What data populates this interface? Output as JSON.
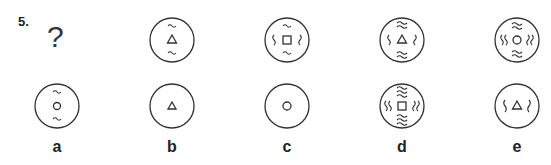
{
  "question": {
    "number": "5.",
    "missing_marker": "?",
    "sequence": [
      {
        "position": 1,
        "content": "missing"
      },
      {
        "position": 2,
        "center_shape": "triangle",
        "top_bottom_waves": 1,
        "left_right_s": 0
      },
      {
        "position": 3,
        "center_shape": "square",
        "top_bottom_waves": 1,
        "left_right_s": 1
      },
      {
        "position": 4,
        "center_shape": "triangle",
        "top_bottom_waves": 2,
        "left_right_s": 1
      },
      {
        "position": 5,
        "center_shape": "circle",
        "top_bottom_waves": 2,
        "left_right_s": 2
      }
    ]
  },
  "options": [
    {
      "label": "a",
      "center_shape": "circle",
      "top_bottom_waves": 1,
      "left_right_s": 0
    },
    {
      "label": "b",
      "center_shape": "triangle",
      "top_bottom_waves": 0,
      "left_right_s": 0
    },
    {
      "label": "c",
      "center_shape": "circle",
      "top_bottom_waves": 0,
      "left_right_s": 0
    },
    {
      "label": "d",
      "center_shape": "square",
      "top_bottom_waves": 3,
      "left_right_s": 2
    },
    {
      "label": "e",
      "center_shape": "triangle",
      "top_bottom_waves": 0,
      "left_right_s": 1
    }
  ]
}
